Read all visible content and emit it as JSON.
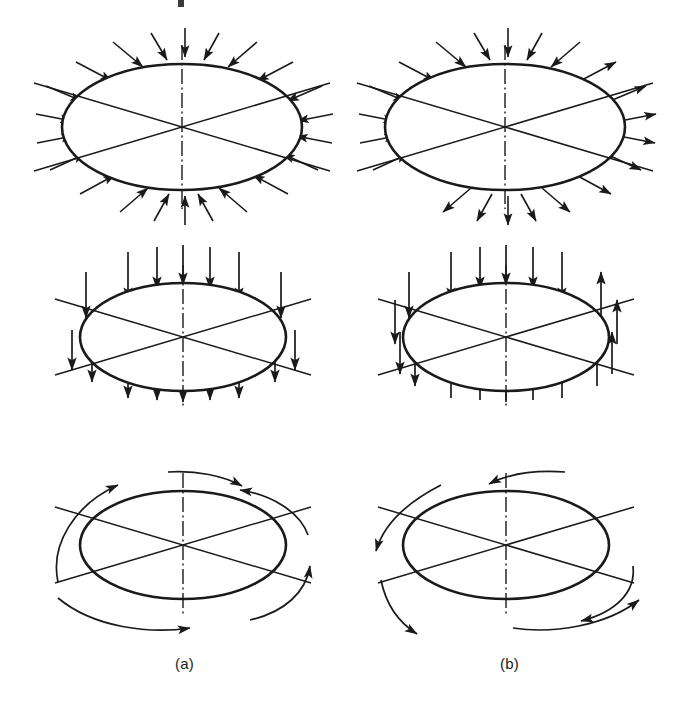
{
  "figure": {
    "title": "",
    "width": 679,
    "height": 702,
    "background": "#ffffff",
    "stroke_color": "#1a1a1a",
    "columns": [
      {
        "key": "a",
        "label": "(a)",
        "x": 175,
        "y": 665
      },
      {
        "key": "b",
        "label": "(b)",
        "x": 500,
        "y": 665
      }
    ],
    "rows": [
      {
        "key": "row1",
        "name": "radial-loading-row",
        "description_a": "uniform radial compression, all arrows point inward",
        "description_b": "shear / unbalanced radial loading, upper-left arrows inward and lower-right arrows outward"
      },
      {
        "key": "row2",
        "name": "axial-loading-row",
        "description_a": "uniaxial vertical compression, all arrows point downward",
        "description_b": "couple, left and top arrows downward, right and bottom arrows upward"
      },
      {
        "key": "row3",
        "name": "torsional-loading-row",
        "description_a": "torsion, curved arrows all in one rotational sense",
        "description_b": "opposed torsion, curved arrows in opposing rotational senses"
      }
    ],
    "ellipses": [
      {
        "id": "a1",
        "cx": 182,
        "cy": 127,
        "rx": 120,
        "ry": 63
      },
      {
        "id": "b1",
        "cx": 505,
        "cy": 127,
        "rx": 120,
        "ry": 63
      },
      {
        "id": "a2",
        "cx": 183,
        "cy": 337,
        "rx": 103,
        "ry": 54
      },
      {
        "id": "b2",
        "cx": 506,
        "cy": 337,
        "rx": 103,
        "ry": 54
      },
      {
        "id": "a3",
        "cx": 183,
        "cy": 545,
        "rx": 103,
        "ry": 54
      },
      {
        "id": "b3",
        "cx": 506,
        "cy": 545,
        "rx": 103,
        "ry": 54
      }
    ],
    "line_style": {
      "ellipse_width": 2.6,
      "diagonal_width": 1.5,
      "arrow_width": 1.6,
      "centerline_width": 1.4,
      "centerline_dash": "14 3 2 3"
    }
  }
}
